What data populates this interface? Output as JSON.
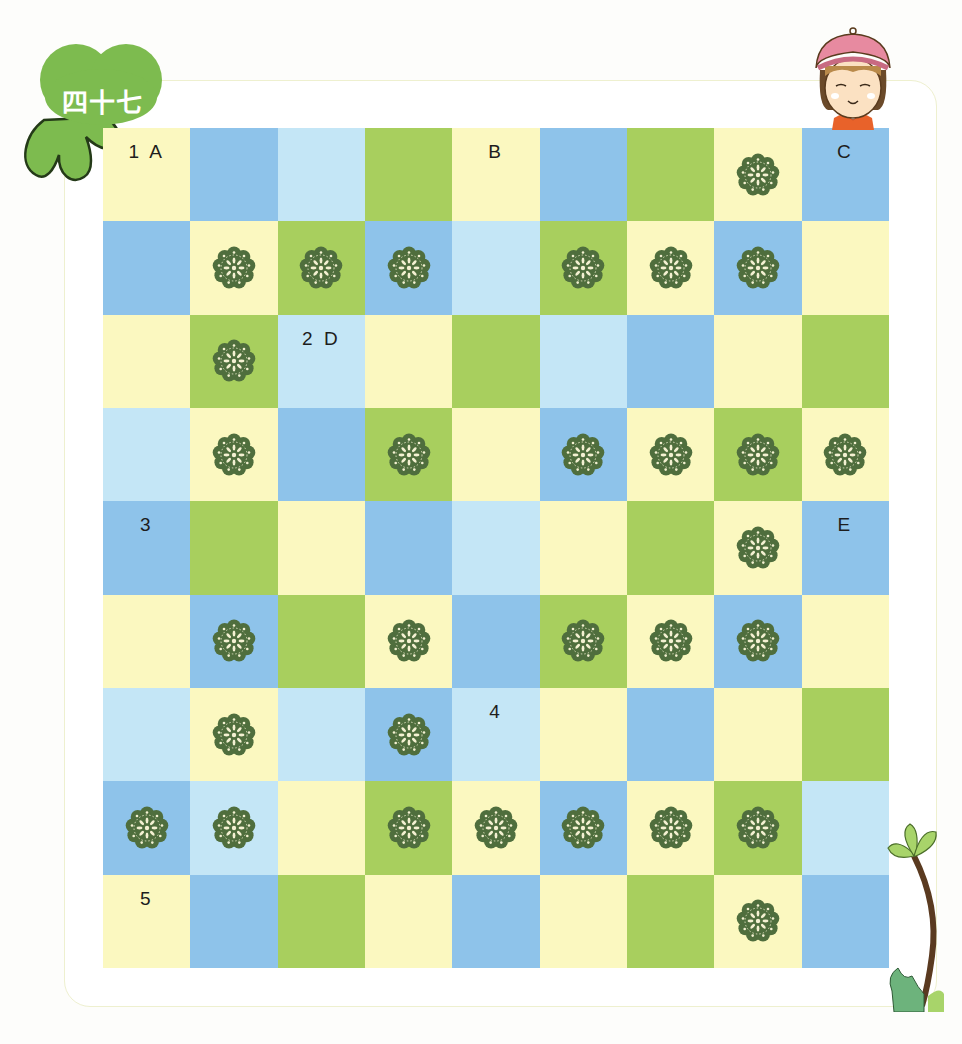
{
  "badge": {
    "label": "四十七",
    "color": "#7dbb4f"
  },
  "colors": {
    "Y": "#fbf8c0",
    "B": "#8ec3ea",
    "L": "#c4e6f6",
    "G": "#a8cf5e",
    "flower": "#4f6e3d"
  },
  "board": {
    "rows": 9,
    "cols": 9,
    "legend": {
      "Y": "pale-yellow",
      "B": "blue",
      "L": "light-blue",
      "G": "green",
      "f": "flower"
    },
    "cells": [
      [
        {
          "c": "Y",
          "label": "1 A"
        },
        {
          "c": "B"
        },
        {
          "c": "L"
        },
        {
          "c": "G"
        },
        {
          "c": "Y",
          "label": "B"
        },
        {
          "c": "B"
        },
        {
          "c": "G"
        },
        {
          "c": "Y",
          "flower": true
        },
        {
          "c": "B",
          "label": "C"
        }
      ],
      [
        {
          "c": "B"
        },
        {
          "c": "Y",
          "flower": true
        },
        {
          "c": "G",
          "flower": true
        },
        {
          "c": "B",
          "flower": true
        },
        {
          "c": "L"
        },
        {
          "c": "G",
          "flower": true
        },
        {
          "c": "Y",
          "flower": true
        },
        {
          "c": "B",
          "flower": true
        },
        {
          "c": "Y"
        }
      ],
      [
        {
          "c": "Y"
        },
        {
          "c": "G",
          "flower": true
        },
        {
          "c": "L",
          "label": "2 D"
        },
        {
          "c": "Y"
        },
        {
          "c": "G"
        },
        {
          "c": "L"
        },
        {
          "c": "B"
        },
        {
          "c": "Y"
        },
        {
          "c": "G"
        }
      ],
      [
        {
          "c": "L"
        },
        {
          "c": "Y",
          "flower": true
        },
        {
          "c": "B"
        },
        {
          "c": "G",
          "flower": true
        },
        {
          "c": "Y"
        },
        {
          "c": "B",
          "flower": true
        },
        {
          "c": "Y",
          "flower": true
        },
        {
          "c": "G",
          "flower": true
        },
        {
          "c": "Y",
          "flower": true
        }
      ],
      [
        {
          "c": "B",
          "label": "3"
        },
        {
          "c": "G"
        },
        {
          "c": "Y"
        },
        {
          "c": "B"
        },
        {
          "c": "L"
        },
        {
          "c": "Y"
        },
        {
          "c": "G"
        },
        {
          "c": "Y",
          "flower": true
        },
        {
          "c": "B",
          "label": "E"
        }
      ],
      [
        {
          "c": "Y"
        },
        {
          "c": "B",
          "flower": true
        },
        {
          "c": "G"
        },
        {
          "c": "Y",
          "flower": true
        },
        {
          "c": "B"
        },
        {
          "c": "G",
          "flower": true
        },
        {
          "c": "Y",
          "flower": true
        },
        {
          "c": "B",
          "flower": true
        },
        {
          "c": "Y"
        }
      ],
      [
        {
          "c": "L"
        },
        {
          "c": "Y",
          "flower": true
        },
        {
          "c": "L"
        },
        {
          "c": "B",
          "flower": true
        },
        {
          "c": "L",
          "label": "4"
        },
        {
          "c": "Y"
        },
        {
          "c": "B"
        },
        {
          "c": "Y"
        },
        {
          "c": "G"
        }
      ],
      [
        {
          "c": "B",
          "flower": true
        },
        {
          "c": "L",
          "flower": true
        },
        {
          "c": "Y"
        },
        {
          "c": "G",
          "flower": true
        },
        {
          "c": "Y",
          "flower": true
        },
        {
          "c": "B",
          "flower": true
        },
        {
          "c": "Y",
          "flower": true
        },
        {
          "c": "G",
          "flower": true
        },
        {
          "c": "L"
        }
      ],
      [
        {
          "c": "Y",
          "label": "5"
        },
        {
          "c": "B"
        },
        {
          "c": "G"
        },
        {
          "c": "Y"
        },
        {
          "c": "B"
        },
        {
          "c": "Y"
        },
        {
          "c": "G"
        },
        {
          "c": "Y",
          "flower": true
        },
        {
          "c": "B"
        }
      ]
    ]
  },
  "decorations": {
    "top_right": "girl-with-pink-hat",
    "bottom_right": "sprout-plant",
    "top_left": "leaf-badge"
  }
}
